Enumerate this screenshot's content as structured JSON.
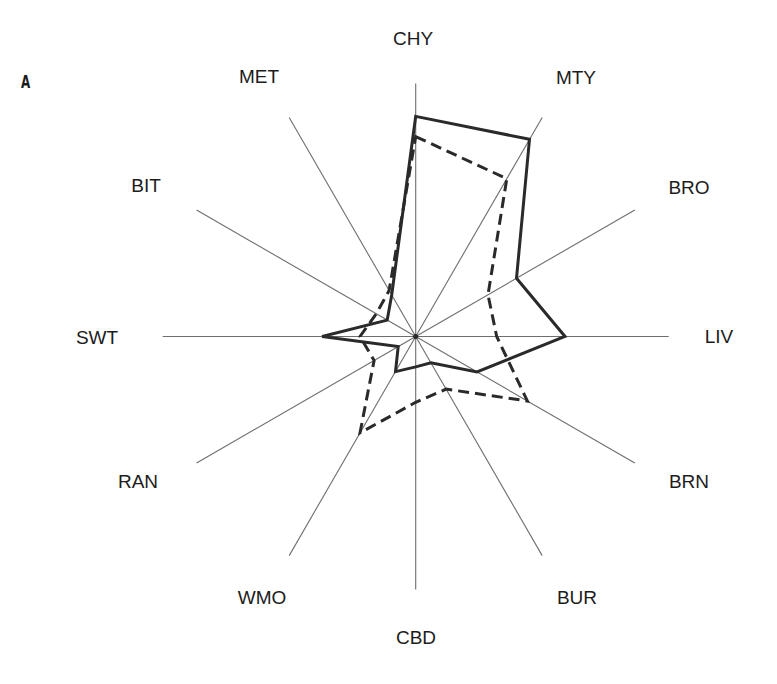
{
  "panel_label": "A",
  "chart_data": {
    "type": "radar",
    "title": "",
    "panel": "A",
    "axes": [
      "CHY",
      "MTY",
      "BRO",
      "LIV",
      "BRN",
      "BUR",
      "CBD",
      "WMO",
      "RAN",
      "SWT",
      "BIT",
      "MET"
    ],
    "scale": "relative (percent of axis length)",
    "rlim": [
      0,
      100
    ],
    "grid": false,
    "legend": null,
    "series": [
      {
        "name": "solid",
        "line_style": "solid",
        "color": "#2a2a2a",
        "values": [
          87,
          90,
          46,
          59,
          28,
          12,
          12,
          16,
          8,
          37,
          13,
          19
        ]
      },
      {
        "name": "dashed",
        "line_style": "dashed",
        "color": "#2a2a2a",
        "values": [
          79,
          72,
          33,
          32,
          51,
          24,
          26,
          44,
          19,
          22,
          18,
          21
        ]
      }
    ]
  },
  "colors": {
    "axis": "#6e6e6e",
    "series": "#2a2a2a",
    "text": "#1c1c1c",
    "background": "#ffffff"
  }
}
